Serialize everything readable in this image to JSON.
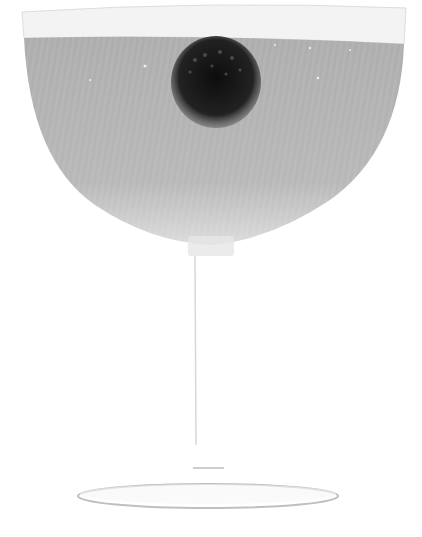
{
  "image": {
    "subject": "Coupe cocktail glass with a blackberry floating in pale liquid",
    "colors": {
      "background": "#ffffff",
      "liquid": "#b3b3b3",
      "liquid_edge": "#d6d6d6",
      "rim": "#f2f2f2",
      "berry": "#1a1a1a",
      "glass_outline": "#c8c8c8"
    },
    "elements": {
      "bowl": "coupe-bowl",
      "berry": "blackberry",
      "stem": "glass-stem",
      "base": "glass-foot"
    }
  }
}
